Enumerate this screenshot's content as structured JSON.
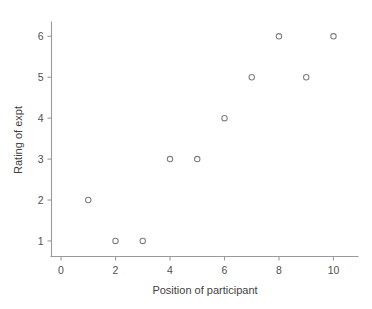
{
  "chart_data": {
    "type": "scatter",
    "title": "",
    "xlabel": "Position of participant",
    "ylabel": "Rating of expt",
    "xlim": [
      -0.35,
      10.9
    ],
    "ylim": [
      0.62,
      6.35
    ],
    "xticks": [
      0,
      2,
      4,
      6,
      8,
      10
    ],
    "xtick_labels": [
      "0",
      "2",
      "4",
      "6",
      "8",
      "10"
    ],
    "yticks": [
      1,
      2,
      3,
      4,
      5,
      6
    ],
    "ytick_labels": [
      "1",
      "2",
      "3",
      "4",
      "5",
      "6"
    ],
    "grid": false,
    "legend": null,
    "marker": "open-circle",
    "marker_color": "#7d7d86",
    "x": [
      1,
      2,
      3,
      4,
      5,
      6,
      7,
      8,
      9,
      10
    ],
    "y": [
      2,
      1,
      1,
      3,
      3,
      4,
      5,
      6,
      5,
      6
    ],
    "points": [
      {
        "x": 1,
        "y": 2
      },
      {
        "x": 2,
        "y": 1
      },
      {
        "x": 3,
        "y": 1
      },
      {
        "x": 4,
        "y": 3
      },
      {
        "x": 5,
        "y": 3
      },
      {
        "x": 6,
        "y": 4
      },
      {
        "x": 7,
        "y": 5
      },
      {
        "x": 8,
        "y": 6
      },
      {
        "x": 9,
        "y": 5
      },
      {
        "x": 10,
        "y": 6
      }
    ]
  },
  "figure": {
    "background": "#ffffff",
    "axis_color": "#9a9a9a",
    "text_color": "#4f4f4f"
  }
}
